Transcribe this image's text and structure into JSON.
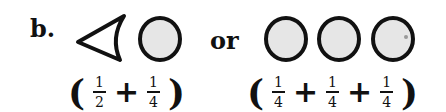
{
  "label": "b.",
  "connector": "or",
  "option_a": {
    "shapes": [
      "triangle-icon",
      "circle-icon"
    ],
    "expression": {
      "open": "(",
      "close": ")",
      "plus": "+",
      "terms": [
        {
          "num": "1",
          "den": "2"
        },
        {
          "num": "1",
          "den": "4"
        }
      ]
    }
  },
  "option_b": {
    "shapes": [
      "circle-icon",
      "circle-icon",
      "circle-icon"
    ],
    "expression": {
      "open": "(",
      "close": ")",
      "plus": "+",
      "terms": [
        {
          "num": "1",
          "den": "4"
        },
        {
          "num": "1",
          "den": "4"
        },
        {
          "num": "1",
          "den": "4"
        }
      ]
    }
  },
  "colors": {
    "stroke": "#111111",
    "fill": "#e6e6e6"
  }
}
